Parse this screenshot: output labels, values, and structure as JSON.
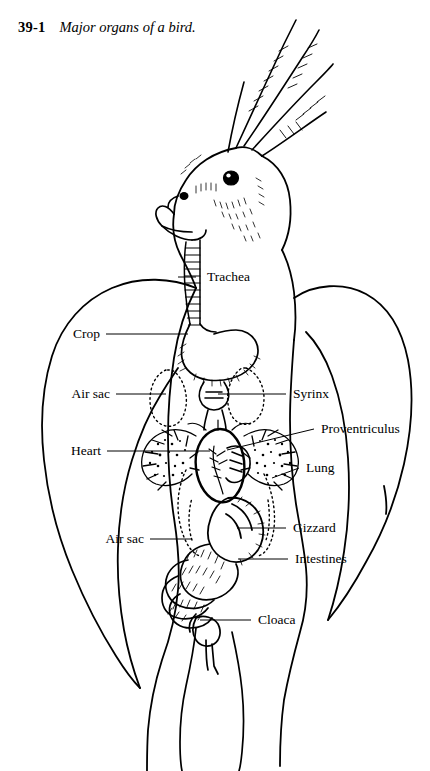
{
  "caption": {
    "figure_number": "39-1",
    "title": "Major organs of a bird."
  },
  "diagram": {
    "species_depicted": "cockatiel",
    "view": "ventral dissection showing major internal organs",
    "style": {
      "line_color": "#000000",
      "background_color": "#ffffff",
      "air_sac_outline": "dotted"
    },
    "labels": [
      {
        "text": "Trachea",
        "side": "right",
        "x": 207,
        "y": 277,
        "leader_from_x": 196,
        "leader_from_y": 277,
        "leader_to_x": 178,
        "leader_to_y": 277
      },
      {
        "text": "Crop",
        "side": "left",
        "x": 100,
        "y": 334,
        "leader_from_x": 106,
        "leader_from_y": 334,
        "leader_to_x": 188,
        "leader_to_y": 334
      },
      {
        "text": "Air sac",
        "side": "left",
        "x": 110,
        "y": 394,
        "leader_from_x": 116,
        "leader_from_y": 394,
        "leader_to_x": 166,
        "leader_to_y": 394
      },
      {
        "text": "Syrinx",
        "side": "right",
        "x": 293,
        "y": 394,
        "leader_from_x": 286,
        "leader_from_y": 394,
        "leader_to_x": 218,
        "leader_to_y": 394
      },
      {
        "text": "Proventriculus",
        "side": "right",
        "x": 321,
        "y": 429,
        "leader_from_x": 314,
        "leader_from_y": 429,
        "leader_to_x": 227,
        "leader_to_y": 450
      },
      {
        "text": "Heart",
        "side": "left",
        "x": 101,
        "y": 451,
        "leader_from_x": 107,
        "leader_from_y": 451,
        "leader_to_x": 210,
        "leader_to_y": 451
      },
      {
        "text": "Lung",
        "side": "right",
        "x": 306,
        "y": 468,
        "leader_from_x": 299,
        "leader_from_y": 468,
        "leader_to_x": 272,
        "leader_to_y": 478
      },
      {
        "text": "Gizzard",
        "side": "right",
        "x": 293,
        "y": 528,
        "leader_from_x": 286,
        "leader_from_y": 528,
        "leader_to_x": 237,
        "leader_to_y": 528
      },
      {
        "text": "Air sac",
        "side": "left",
        "x": 144,
        "y": 539,
        "leader_from_x": 150,
        "leader_from_y": 539,
        "leader_to_x": 192,
        "leader_to_y": 539
      },
      {
        "text": "Intestines",
        "side": "right",
        "x": 295,
        "y": 559,
        "leader_from_x": 288,
        "leader_from_y": 559,
        "leader_to_x": 238,
        "leader_to_y": 559
      },
      {
        "text": "Cloaca",
        "side": "right",
        "x": 258,
        "y": 620,
        "leader_from_x": 251,
        "leader_from_y": 620,
        "leader_to_x": 200,
        "leader_to_y": 620
      }
    ],
    "organs": [
      "trachea",
      "crop",
      "air-sac-upper",
      "syrinx",
      "proventriculus",
      "heart",
      "lung",
      "gizzard",
      "air-sac-lower",
      "intestines",
      "cloaca"
    ]
  }
}
